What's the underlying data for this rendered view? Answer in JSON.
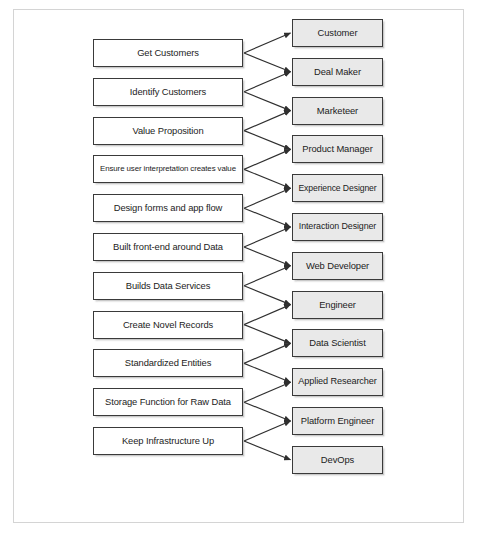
{
  "diagram": {
    "type": "two-column-fan-out",
    "colors": {
      "frame_border": "#d4d4d4",
      "node_border": "#3a3a3a",
      "left_fill": "#ffffff",
      "right_fill": "#e9e9e9",
      "connector": "#333333",
      "text": "#1c1c1c"
    },
    "left_column": {
      "name": "functions",
      "nodes": [
        {
          "id": "l1",
          "label": "Get Customers"
        },
        {
          "id": "l2",
          "label": "Identify Customers"
        },
        {
          "id": "l3",
          "label": "Value Proposition"
        },
        {
          "id": "l4",
          "label": "Ensure user interpretation creates value"
        },
        {
          "id": "l5",
          "label": "Design forms and app flow"
        },
        {
          "id": "l6",
          "label": "Built front-end around Data"
        },
        {
          "id": "l7",
          "label": "Builds Data Services"
        },
        {
          "id": "l8",
          "label": "Create Novel Records"
        },
        {
          "id": "l9",
          "label": "Standardized Entities"
        },
        {
          "id": "l10",
          "label": "Storage Function for Raw Data"
        },
        {
          "id": "l11",
          "label": "Keep Infrastructure Up"
        }
      ]
    },
    "right_column": {
      "name": "roles",
      "nodes": [
        {
          "id": "r1",
          "label": "Customer"
        },
        {
          "id": "r2",
          "label": "Deal Maker"
        },
        {
          "id": "r3",
          "label": "Marketeer"
        },
        {
          "id": "r4",
          "label": "Product Manager"
        },
        {
          "id": "r5",
          "label": "Experience Designer"
        },
        {
          "id": "r6",
          "label": "Interaction Designer"
        },
        {
          "id": "r7",
          "label": "Web Developer"
        },
        {
          "id": "r8",
          "label": "Engineer"
        },
        {
          "id": "r9",
          "label": "Data Scientist"
        },
        {
          "id": "r10",
          "label": "Applied Researcher"
        },
        {
          "id": "r11",
          "label": "Platform Engineer"
        },
        {
          "id": "r12",
          "label": "DevOps"
        }
      ]
    },
    "edges": [
      {
        "from": "l1",
        "to": "r1"
      },
      {
        "from": "l1",
        "to": "r2"
      },
      {
        "from": "l2",
        "to": "r2"
      },
      {
        "from": "l2",
        "to": "r3"
      },
      {
        "from": "l3",
        "to": "r3"
      },
      {
        "from": "l3",
        "to": "r4"
      },
      {
        "from": "l4",
        "to": "r4"
      },
      {
        "from": "l4",
        "to": "r5"
      },
      {
        "from": "l5",
        "to": "r5"
      },
      {
        "from": "l5",
        "to": "r6"
      },
      {
        "from": "l6",
        "to": "r6"
      },
      {
        "from": "l6",
        "to": "r7"
      },
      {
        "from": "l7",
        "to": "r7"
      },
      {
        "from": "l7",
        "to": "r8"
      },
      {
        "from": "l8",
        "to": "r8"
      },
      {
        "from": "l8",
        "to": "r9"
      },
      {
        "from": "l9",
        "to": "r9"
      },
      {
        "from": "l9",
        "to": "r10"
      },
      {
        "from": "l10",
        "to": "r10"
      },
      {
        "from": "l10",
        "to": "r11"
      },
      {
        "from": "l11",
        "to": "r11"
      },
      {
        "from": "l11",
        "to": "r12"
      }
    ],
    "layout": {
      "left": {
        "x": 93,
        "width": 150,
        "height": 28,
        "first_y": 39,
        "pitch": 38.8
      },
      "right": {
        "x": 292,
        "width": 91,
        "height": 28,
        "first_y": 19,
        "pitch": 38.8
      }
    }
  }
}
